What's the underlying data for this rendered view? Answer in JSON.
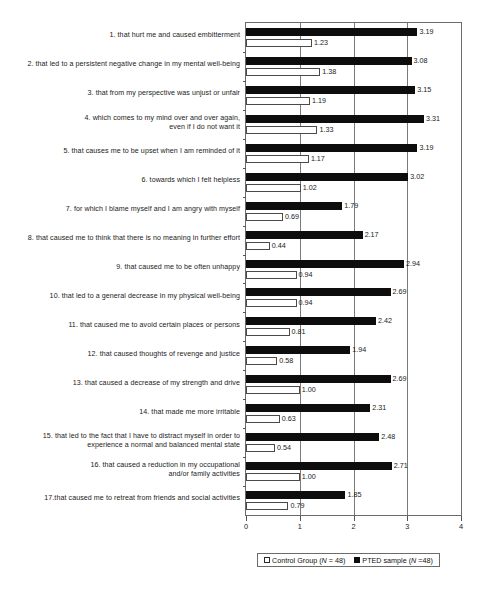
{
  "chart_data": {
    "type": "bar",
    "orientation": "horizontal",
    "title": "",
    "xlabel": "",
    "ylabel": "",
    "xlim": [
      0,
      4
    ],
    "xticks": [
      "0",
      "1",
      "2",
      "3",
      "4"
    ],
    "grid": true,
    "legend_position": "bottom",
    "categories": [
      "1. that hurt me and caused embitterment",
      "2. that led to a persistent negative change in my mental well-being",
      "3. that from my perspective was unjust or unfair",
      "4. which comes to my mind over and over again,\neven if I do not want it",
      "5. that causes me to be upset when I am reminded of it",
      "6. towards which I felt helpless",
      "7. for which I blame myself and I am angry with myself",
      "8. that caused me to think that there is no meaning in further effort",
      "9. that caused me to be often unhappy",
      "10. that led to a general decrease in my physical well-being",
      "11. that caused me to avoid certain places or persons",
      "12. that caused thoughts of revenge and justice",
      "13. that caused a decrease of my strength and drive",
      "14. that made me more irritable",
      "15. that led to the fact that I have to distract myself in order to\nexperience a normal and balanced mental state",
      "16. that caused a reduction in my occupational\nand/or family activities",
      "17.that caused me to retreat from friends and social activities"
    ],
    "series": [
      {
        "name": "PTED sample (N =48)",
        "color": "#0d0d0d",
        "values": [
          3.19,
          3.08,
          3.15,
          3.31,
          3.19,
          3.02,
          1.79,
          2.17,
          2.94,
          2.69,
          2.42,
          1.94,
          2.69,
          2.31,
          2.48,
          2.71,
          1.85
        ],
        "labels": [
          "3.19",
          "3.08",
          "3.15",
          "3.31",
          "3.19",
          "3.02",
          "1.79",
          "2.17",
          "2.94",
          "2.69",
          "2.42",
          "1.94",
          "2.69",
          "2.31",
          "2.48",
          "2.71",
          "1.85"
        ]
      },
      {
        "name": "Control Group (N = 48)",
        "color": "#ffffff",
        "values": [
          1.23,
          1.38,
          1.19,
          1.33,
          1.17,
          1.02,
          0.69,
          0.44,
          0.94,
          0.94,
          0.81,
          0.58,
          1.0,
          0.63,
          0.54,
          1.0,
          0.79
        ],
        "labels": [
          "1.23",
          "1.38",
          "1.19",
          "1.33",
          "1.17",
          "1.02",
          "0.69",
          "0.44",
          "0.94",
          "0.94",
          "0.81",
          "0.58",
          "1.00",
          "0.63",
          "0.54",
          "1.00",
          "0.79"
        ]
      }
    ]
  },
  "legend": {
    "control": {
      "label_prefix": "Control Group (",
      "label_italic": "N",
      "label_suffix": " = 48)"
    },
    "pted": {
      "label_prefix": "PTED sample (",
      "label_italic": "N",
      "label_suffix": " =48)"
    }
  }
}
